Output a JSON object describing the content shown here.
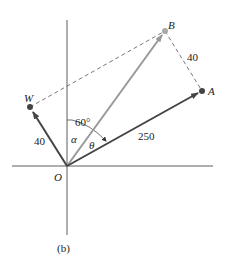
{
  "figure": {
    "caption": "(b)",
    "colors": {
      "axis": "#333333",
      "vector_dark": "#444444",
      "vector_light": "#999999",
      "dashed": "#555555",
      "point_dark": "#444444",
      "point_light": "#aaaaaa"
    },
    "points": {
      "origin": {
        "label": "O",
        "x": 67,
        "y": 166
      },
      "W": {
        "label": "W",
        "x": 30,
        "y": 107
      },
      "B": {
        "label": "B",
        "x": 165,
        "y": 31
      },
      "A": {
        "label": "A",
        "x": 202,
        "y": 91
      }
    },
    "vectors": [
      {
        "name": "OW",
        "magnitude_label": "40"
      },
      {
        "name": "OA",
        "magnitude_label": "250"
      },
      {
        "name": "OB",
        "magnitude_label": ""
      }
    ],
    "dashed_segments": [
      {
        "from": "W",
        "to": "B"
      },
      {
        "from": "B",
        "to": "A",
        "length_label": "40"
      }
    ],
    "angles": {
      "between_axis_and_OA": "60°",
      "alpha": "α",
      "theta": "θ"
    }
  }
}
